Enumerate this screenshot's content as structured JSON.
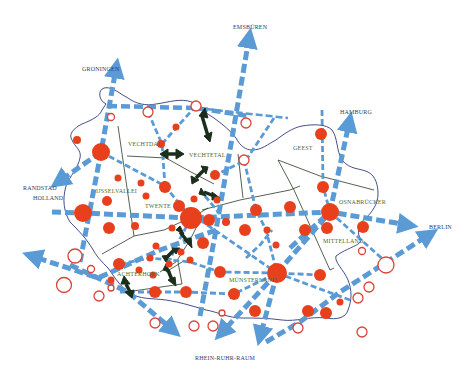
{
  "diagram": {
    "type": "regional network map",
    "colors": {
      "corridor": "#5b9bd5",
      "node_fill": "#e8401c",
      "node_open_stroke": "#d9443a",
      "border": "#2f3b78",
      "region_line": "#2a3a24",
      "exchange_arrow": "#1b2e1b",
      "external_label": "#2e3a6e",
      "region_label": "#4f6b2a"
    },
    "external_destinations": [
      {
        "id": "groningen",
        "label": "Groningen"
      },
      {
        "id": "emsbueren",
        "label": "Emsbüren"
      },
      {
        "id": "hamburg",
        "label": "Hamburg"
      },
      {
        "id": "randstad",
        "label_line1": "Randstad",
        "label_line2": "Holland"
      },
      {
        "id": "berlin",
        "label": "Berlin"
      },
      {
        "id": "rhein-ruhr",
        "label": "Rhein-Ruhr-Raum"
      }
    ],
    "regions": [
      {
        "id": "vechtdal",
        "label": "Vechtdal"
      },
      {
        "id": "vechtetal",
        "label": "Vechtetal"
      },
      {
        "id": "ijsselvallei",
        "label": "IJsselvallei"
      },
      {
        "id": "twente",
        "label": "Twente"
      },
      {
        "id": "geest",
        "label": "Geest"
      },
      {
        "id": "osnabruecker",
        "label": "Osnabrücker"
      },
      {
        "id": "mittelland",
        "label": "Mittelland"
      },
      {
        "id": "muensterland",
        "label": "Münsterland"
      },
      {
        "id": "achterhoek",
        "label": "Achterhoek"
      }
    ]
  }
}
